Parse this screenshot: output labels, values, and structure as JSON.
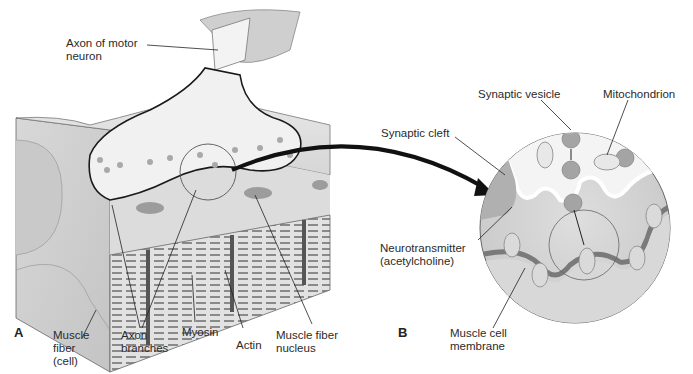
{
  "figure": {
    "panels": [
      {
        "id": "A",
        "label": "A"
      },
      {
        "id": "B",
        "label": "B"
      }
    ],
    "labels": {
      "axon_of_motor_neuron": "Axon of motor\nneuron",
      "muscle_fiber_cell": "Muscle\nfiber\n(cell)",
      "axon_branches": "Axon\nbranches",
      "myosin": "Myosin",
      "actin": "Actin",
      "muscle_fiber_nucleus": "Muscle fiber\nnucleus",
      "synaptic_vesicle": "Synaptic vesicle",
      "mitochondrion": "Mitochondrion",
      "synaptic_cleft": "Synaptic cleft",
      "neurotransmitter": "Neurotransmitter\n(acetylcholine)",
      "muscle_cell_membrane": "Muscle cell\nmembrane"
    },
    "colors": {
      "background": "#ffffff",
      "muscle_light": "#e4e4e4",
      "muscle_mid": "#cfcfcf",
      "muscle_dark": "#a8a8a8",
      "axon_fill": "#f2f2f2",
      "outline": "#1a1a1a",
      "vesicle": "#a9a9a9",
      "arrow": "#111111"
    }
  }
}
